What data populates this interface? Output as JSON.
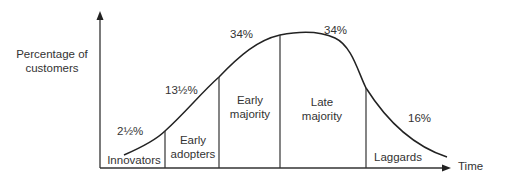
{
  "diagram": {
    "y_axis_label_line1": "Percentage of",
    "y_axis_label_line2": "customers",
    "x_axis_label": "Time",
    "segments": [
      {
        "name": "Innovators",
        "line1": "Innovators",
        "line2": "",
        "percent": "2½%"
      },
      {
        "name": "Early adopters",
        "line1": "Early",
        "line2": "adopters",
        "percent": "13½%"
      },
      {
        "name": "Early majority",
        "line1": "Early",
        "line2": "majority",
        "percent": "34%"
      },
      {
        "name": "Late majority",
        "line1": "Late",
        "line2": "majority",
        "percent": "34%"
      },
      {
        "name": "Laggards",
        "line1": "Laggards",
        "line2": "",
        "percent": "16%"
      }
    ],
    "colors": {
      "line": "#2a2a2a",
      "text": "#333333",
      "background": "#ffffff"
    }
  }
}
